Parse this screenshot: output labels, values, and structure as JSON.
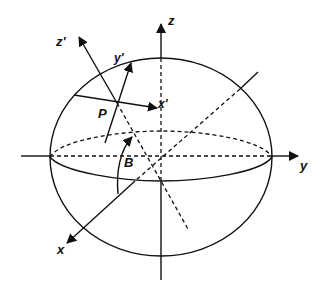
{
  "diagram": {
    "type": "ellipsoid-coordinate-systems",
    "labels": {
      "x": "x",
      "y": "y",
      "z": "z",
      "x_prime": "x'",
      "y_prime": "y'",
      "z_prime": "z'",
      "point": "P",
      "angle": "B"
    },
    "colors": {
      "ink": "#111111",
      "background": "#ffffff"
    }
  }
}
